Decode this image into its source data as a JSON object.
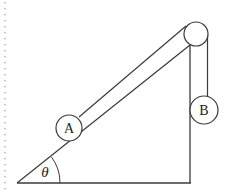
{
  "diagram": {
    "type": "physics-incline-pulley",
    "colors": {
      "stroke": "#3a3a3a",
      "background": "#ffffff",
      "dotted_border": "#9a9a9a"
    },
    "labels": {
      "block_a": "A",
      "block_b": "B",
      "angle": "θ"
    },
    "geometry": {
      "incline_vertex": [
        17,
        183
      ],
      "base_end": [
        190,
        183
      ],
      "wall_top": [
        190,
        46
      ],
      "pulley_center": [
        196,
        34
      ],
      "pulley_radius": 12,
      "ball_a_center": [
        69,
        128
      ],
      "ball_a_radius": 13,
      "ball_b_center": [
        204,
        110
      ],
      "ball_b_radius": 14
    }
  }
}
